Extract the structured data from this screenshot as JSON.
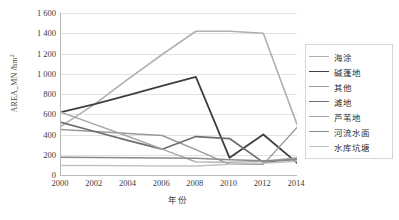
{
  "chart_data": {
    "type": "line",
    "title": "",
    "xlabel": "年份",
    "ylabel": "AREA_MN /hm²",
    "ylabel_main": "AREA_MN /hm",
    "ylabel_sup": "2",
    "x": [
      2000,
      2002,
      2004,
      2006,
      2008,
      2010,
      2012,
      2014
    ],
    "xlim": [
      2000,
      2014
    ],
    "ylim": [
      0,
      1600
    ],
    "ytick_values": [
      0,
      200,
      400,
      600,
      800,
      1000,
      1200,
      1400,
      1600
    ],
    "ytick_labels": [
      "0",
      "200",
      "400",
      "600",
      "800",
      "1 000",
      "1 200",
      "1 400",
      "1 600"
    ],
    "xtick_labels": [
      "2000",
      "2002",
      "2004",
      "2006",
      "2008",
      "2010",
      "2012",
      "2014"
    ],
    "grid": "horizontal",
    "legend_position": "right",
    "series": [
      {
        "name": "海涂",
        "color": "#b0b0b0",
        "width": 1.6,
        "values": [
          480,
          700,
          950,
          1190,
          1420,
          1420,
          1400,
          500
        ]
      },
      {
        "name": "碱蓬地",
        "color": "#3f3f3f",
        "width": 1.8,
        "values": [
          620,
          700,
          790,
          880,
          970,
          170,
          400,
          120
        ]
      },
      {
        "name": "其他",
        "color": "#9a9a9a",
        "width": 1.4,
        "values": [
          450,
          430,
          410,
          390,
          250,
          105,
          105,
          470
        ]
      },
      {
        "name": "滩地",
        "color": "#6e6e6e",
        "width": 1.7,
        "values": [
          520,
          430,
          340,
          255,
          380,
          360,
          125,
          160
        ]
      },
      {
        "name": "芦苇地",
        "color": "#a6a6a6",
        "width": 1.4,
        "values": [
          620,
          500,
          380,
          255,
          130,
          125,
          135,
          170
        ]
      },
      {
        "name": "河流水面",
        "color": "#8c8c8c",
        "width": 1.5,
        "values": [
          175,
          173,
          170,
          168,
          165,
          150,
          140,
          150
        ]
      },
      {
        "name": "水库坑塘",
        "color": "#c2c2c2",
        "width": 1.5,
        "values": [
          95,
          93,
          92,
          90,
          88,
          105,
          115,
          135
        ]
      }
    ]
  },
  "legend": {
    "items": [
      {
        "label": "海涂"
      },
      {
        "label": "碱蓬地"
      },
      {
        "label": "其他"
      },
      {
        "label": "滩地"
      },
      {
        "label": "芦苇地"
      },
      {
        "label": "河流水面"
      },
      {
        "label": "水库坑塘"
      }
    ]
  }
}
